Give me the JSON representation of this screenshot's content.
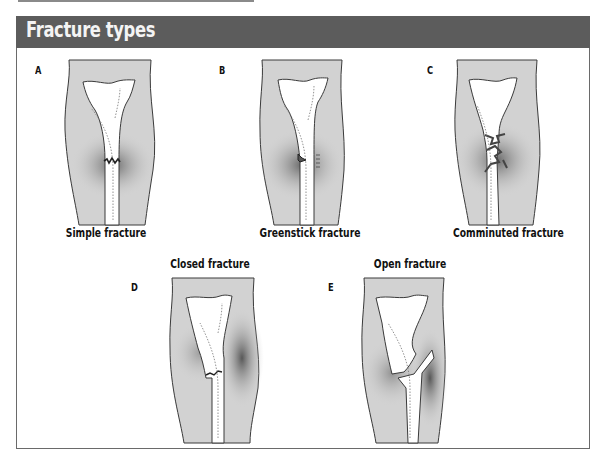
{
  "title": "Fracture types",
  "colors": {
    "header_bg": "#5c5c5c",
    "header_text": "#f4f4f4",
    "limb_fill": "#d2d2d2",
    "bruise": "#6e6e6e",
    "bone_fill": "#ffffff",
    "outline": "#3a3a3a"
  },
  "panels": [
    {
      "letter": "A",
      "caption": "Simple fracture"
    },
    {
      "letter": "B",
      "caption": "Greenstick fracture"
    },
    {
      "letter": "C",
      "caption": "Comminuted fracture"
    },
    {
      "letter": "D",
      "caption": "Closed fracture"
    },
    {
      "letter": "E",
      "caption": "Open fracture"
    }
  ]
}
